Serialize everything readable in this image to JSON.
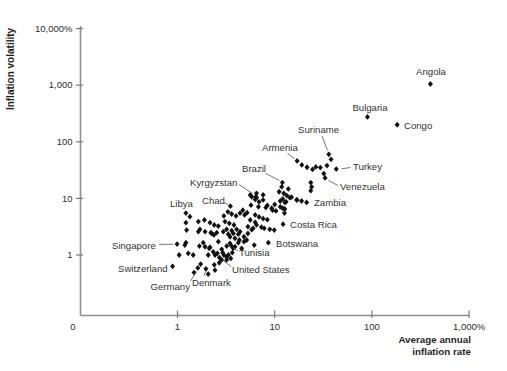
{
  "chart_data": {
    "type": "scatter",
    "title": "",
    "ylabel": "Inflation volatility",
    "xlabel_lines": [
      "Average annual",
      "inflation rate"
    ],
    "grid": false,
    "marker": {
      "shape": "diamond",
      "color": "#121212"
    },
    "x_axis": {
      "scale": "log",
      "origin_label": "0",
      "range": [
        1,
        1000
      ],
      "ticks": [
        {
          "value": 1,
          "label": "1"
        },
        {
          "value": 10,
          "label": "10"
        },
        {
          "value": 100,
          "label": "100"
        },
        {
          "value": 1000,
          "label": "1,000%"
        }
      ]
    },
    "y_axis": {
      "scale": "log",
      "range": [
        1,
        10000
      ],
      "ticks": [
        {
          "value": 1,
          "label": "1"
        },
        {
          "value": 10,
          "label": "10"
        },
        {
          "value": 100,
          "label": "100"
        },
        {
          "value": 1000,
          "label": "1,000"
        },
        {
          "value": 10000,
          "label": "10,000%"
        }
      ]
    },
    "labeled_points": [
      {
        "name": "Angola",
        "x": 400,
        "y": 1050,
        "label_px": {
          "x": 431,
          "y": 75,
          "anchor": "middle"
        },
        "leader_px": null
      },
      {
        "name": "Bulgaria",
        "x": 90,
        "y": 275,
        "label_px": {
          "x": 370,
          "y": 110.5,
          "anchor": "middle"
        },
        "leader_px": null
      },
      {
        "name": "Congo",
        "x": 182,
        "y": 200,
        "label_px": {
          "x": 404,
          "y": 128.5,
          "anchor": "start"
        },
        "leader_px": null
      },
      {
        "name": "Suriname",
        "x": 36,
        "y": 60,
        "label_px": {
          "x": 298,
          "y": 133,
          "anchor": "start"
        },
        "leader_px": [
          322,
          136,
          327.5,
          150.5
        ]
      },
      {
        "name": "Armenia",
        "x": 17,
        "y": 46,
        "label_px": {
          "x": 262,
          "y": 151,
          "anchor": "start"
        },
        "leader_px": [
          287.5,
          153.5,
          294.5,
          158.5
        ]
      },
      {
        "name": "Turkey",
        "x": 43,
        "y": 33,
        "label_px": {
          "x": 353,
          "y": 170,
          "anchor": "start"
        },
        "leader_px": [
          350.5,
          167.5,
          341.5,
          168.8
        ]
      },
      {
        "name": "Venezuela",
        "x": 33,
        "y": 23,
        "label_px": {
          "x": 340,
          "y": 189.5,
          "anchor": "start"
        },
        "leader_px": [
          338,
          185.5,
          328.5,
          180.5
        ]
      },
      {
        "name": "Zambia",
        "x": 21.3,
        "y": 8.5,
        "label_px": {
          "x": 314,
          "y": 206,
          "anchor": "start"
        },
        "leader_px": null
      },
      {
        "name": "Brazil",
        "x": 12,
        "y": 19,
        "label_px": {
          "x": 242,
          "y": 172,
          "anchor": "start"
        },
        "leader_px": [
          266,
          173.5,
          279.5,
          180.5
        ]
      },
      {
        "name": "Kyrgyzstan",
        "x": 6.4,
        "y": 10.7,
        "label_px": {
          "x": 190,
          "y": 186,
          "anchor": "start"
        },
        "leader_px": [
          239,
          184.5,
          252.5,
          193.5
        ]
      },
      {
        "name": "Chad",
        "x": 3.5,
        "y": 7.3,
        "label_px": {
          "x": 202,
          "y": 204,
          "anchor": "start"
        },
        "leader_px": [
          224,
          202.5,
          228.5,
          205
        ]
      },
      {
        "name": "Libya",
        "x": 1.22,
        "y": 5.5,
        "label_px": {
          "x": 170,
          "y": 207,
          "anchor": "start"
        },
        "leader_px": null
      },
      {
        "name": "Costa Rica",
        "x": 12.2,
        "y": 3.5,
        "label_px": {
          "x": 290,
          "y": 228,
          "anchor": "start"
        },
        "leader_px": null
      },
      {
        "name": "Botswana",
        "x": 8.6,
        "y": 1.65,
        "label_px": {
          "x": 276,
          "y": 247,
          "anchor": "start"
        },
        "leader_px": null
      },
      {
        "name": "Tunisia",
        "x": 3.6,
        "y": 1.44,
        "label_px": {
          "x": 239,
          "y": 256,
          "anchor": "start"
        },
        "leader_px": [
          238,
          251,
          233.5,
          248
        ]
      },
      {
        "name": "United States",
        "x": 2.7,
        "y": 0.9,
        "label_px": {
          "x": 232,
          "y": 272.5,
          "anchor": "start"
        },
        "leader_px": [
          231,
          266.5,
          222.5,
          260
        ]
      },
      {
        "name": "Singapore",
        "x": 0.99,
        "y": 1.56,
        "label_px": {
          "x": 112,
          "y": 248.5,
          "anchor": "start"
        },
        "leader_px": [
          159,
          244.4,
          173.5,
          244.2
        ]
      },
      {
        "name": "Switzerland",
        "x": 0.89,
        "y": 0.63,
        "label_px": {
          "x": 118,
          "y": 271.5,
          "anchor": "start"
        },
        "leader_px": null
      },
      {
        "name": "Germany",
        "x": 1.62,
        "y": 0.59,
        "label_px": {
          "x": 190,
          "y": 290,
          "anchor": "end"
        },
        "leader_px": [
          190.5,
          281,
          196.5,
          271.5
        ]
      },
      {
        "name": "Denmark",
        "x": 1.96,
        "y": 0.57,
        "label_px": {
          "x": 192,
          "y": 285.5,
          "anchor": "start"
        },
        "leader_px": [
          204,
          276,
          205.5,
          271.5
        ]
      }
    ],
    "points": [
      [
        19,
        39
      ],
      [
        21.5,
        35.5
      ],
      [
        24.5,
        32.5
      ],
      [
        26.5,
        36
      ],
      [
        38,
        49
      ],
      [
        34.5,
        38
      ],
      [
        29.5,
        35
      ],
      [
        32,
        27.5
      ],
      [
        23.5,
        19
      ],
      [
        24,
        16
      ],
      [
        23.5,
        13.7
      ],
      [
        11.8,
        16
      ],
      [
        13.8,
        14.7
      ],
      [
        11.1,
        13.1
      ],
      [
        12.4,
        12.3
      ],
      [
        13.3,
        11.2
      ],
      [
        14.3,
        10.3
      ],
      [
        12.1,
        9.8
      ],
      [
        11.4,
        9
      ],
      [
        12.7,
        8.5
      ],
      [
        17,
        9.4
      ],
      [
        10,
        7.8
      ],
      [
        11.4,
        7.1
      ],
      [
        12.7,
        6.5
      ],
      [
        9.5,
        6.2
      ],
      [
        14.9,
        10.5
      ],
      [
        16.8,
        9.4
      ],
      [
        13.1,
        8.7
      ],
      [
        18.9,
        9
      ],
      [
        12.1,
        6.7
      ],
      [
        12.6,
        5.5
      ],
      [
        5.6,
        11.5
      ],
      [
        6.5,
        12.3
      ],
      [
        7.6,
        11.5
      ],
      [
        5.8,
        10.7
      ],
      [
        6.5,
        10.3
      ],
      [
        7.6,
        9.4
      ],
      [
        6.3,
        9.6
      ],
      [
        6.9,
        8.7
      ],
      [
        5.7,
        7.6
      ],
      [
        6.8,
        7.1
      ],
      [
        8.1,
        6.9
      ],
      [
        8.4,
        7.5
      ],
      [
        9.3,
        6.7
      ],
      [
        10.3,
        6
      ],
      [
        4.7,
        6.2
      ],
      [
        5.2,
        5.6
      ],
      [
        6.3,
        5.1
      ],
      [
        6.9,
        4.7
      ],
      [
        7.6,
        4.4
      ],
      [
        8.4,
        4.2
      ],
      [
        3.3,
        5.8
      ],
      [
        3.6,
        5.3
      ],
      [
        4,
        4.9
      ],
      [
        4.4,
        5.5
      ],
      [
        4.9,
        5.1
      ],
      [
        3,
        4.9
      ],
      [
        5.6,
        4.15
      ],
      [
        6.3,
        3.78
      ],
      [
        5.3,
        3.16
      ],
      [
        6,
        2.96
      ],
      [
        7.8,
        2.96
      ],
      [
        8.9,
        2.84
      ],
      [
        9.9,
        2.76
      ],
      [
        1.34,
        4.75
      ],
      [
        1.64,
        3.9
      ],
      [
        1.89,
        4.15
      ],
      [
        2.16,
        3.72
      ],
      [
        2.39,
        3.39
      ],
      [
        1.22,
        3.72
      ],
      [
        1.24,
        2.76
      ],
      [
        1.7,
        2.84
      ],
      [
        2.2,
        2.48
      ],
      [
        2.37,
        2.26
      ],
      [
        2.63,
        3.25
      ],
      [
        3.08,
        3.9
      ],
      [
        3.41,
        3.63
      ],
      [
        3.81,
        3.39
      ],
      [
        3.2,
        2.84
      ],
      [
        3.61,
        2.69
      ],
      [
        4.06,
        2.84
      ],
      [
        4.4,
        2.58
      ],
      [
        6.5,
        3.4
      ],
      [
        7.3,
        3.1
      ],
      [
        1.64,
        2.58
      ],
      [
        1.92,
        2.58
      ],
      [
        2.25,
        2.41
      ],
      [
        2.53,
        2.48
      ],
      [
        2.96,
        2.58
      ],
      [
        3.33,
        2.33
      ],
      [
        3.75,
        2.41
      ],
      [
        4.22,
        2.33
      ],
      [
        5.3,
        2.4
      ],
      [
        5.8,
        2.8
      ],
      [
        3.47,
        2.1
      ],
      [
        3.9,
        1.97
      ],
      [
        4.33,
        1.84
      ],
      [
        4.83,
        2.1
      ],
      [
        5.15,
        1.84
      ],
      [
        6.16,
        1.5
      ],
      [
        2.63,
        1.72
      ],
      [
        1.92,
        1.4
      ],
      [
        2.16,
        1.37
      ],
      [
        4.22,
        1.65
      ],
      [
        4.83,
        1.72
      ],
      [
        3.74,
        1.31
      ],
      [
        2.92,
        1.1
      ],
      [
        3.2,
        0.93
      ],
      [
        2.43,
        1
      ],
      [
        2.85,
        0.82
      ],
      [
        3,
        1
      ],
      [
        2.57,
        1.07
      ],
      [
        2.85,
        1.26
      ],
      [
        3.21,
        1.44
      ],
      [
        1.29,
        1.07
      ],
      [
        1.45,
        1
      ],
      [
        1.04,
        1
      ],
      [
        1.22,
        1.65
      ],
      [
        2.07,
        1
      ],
      [
        2.33,
        1.14
      ],
      [
        3.33,
        1
      ],
      [
        3.66,
        1.1
      ],
      [
        3.9,
        1.4
      ],
      [
        4.57,
        1.31
      ],
      [
        3.47,
        1.61
      ],
      [
        1.68,
        1.44
      ],
      [
        1.84,
        1.65
      ],
      [
        1.19,
        1.5
      ],
      [
        2.12,
        1.31
      ],
      [
        1.73,
        0.69
      ],
      [
        1.48,
        0.49
      ],
      [
        2.43,
        0.54
      ],
      [
        2.69,
        0.73
      ],
      [
        3.2,
        0.82
      ],
      [
        2.07,
        0.46
      ],
      [
        2.39,
        0.67
      ],
      [
        3.53,
        0.87
      ]
    ]
  },
  "colors": {
    "background": "#ffffff",
    "axis": "#8e8e8e",
    "tick": "#7a7a7a",
    "tick_text": "#2b2b2b",
    "axis_title": "#1f1f1f",
    "country_text": "#333333",
    "leader": "#666666",
    "point": "#121212"
  }
}
